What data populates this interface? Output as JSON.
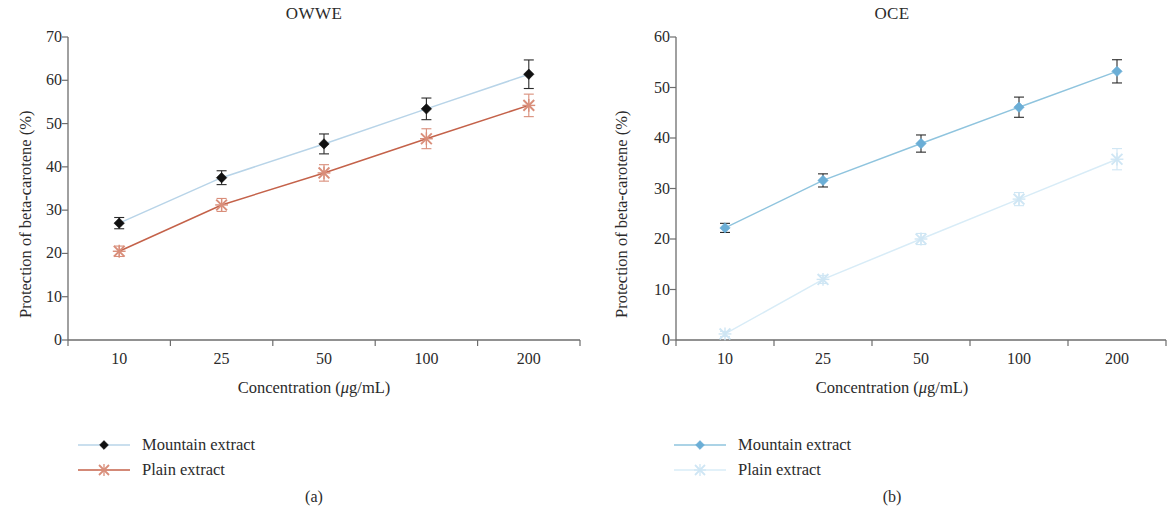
{
  "figure": {
    "subcaptions": [
      "(a)",
      "(b)"
    ]
  },
  "panels": [
    {
      "id": "a",
      "title": "OWWE",
      "subcaption": "(a)",
      "xlabel_prefix": "Concentration (",
      "xlabel_mu": "μ",
      "xlabel_suffix": "g/mL)",
      "ylabel": "Protection of beta-carotene (%)",
      "yticks": [
        "70",
        "60",
        "50",
        "40",
        "30",
        "20",
        "10",
        "0"
      ],
      "xticks": [
        "10",
        "25",
        "50",
        "100",
        "200"
      ],
      "legend": [
        {
          "label": "Mountain extract",
          "marker": "diamond",
          "color": "#111111",
          "line_color": "#b8d4e8"
        },
        {
          "label": "Plain extract",
          "marker": "cross",
          "color": "#d98e7a",
          "line_color": "#c4624a"
        }
      ]
    },
    {
      "id": "b",
      "title": "OCE",
      "subcaption": "(b)",
      "xlabel_prefix": "Concentration (",
      "xlabel_mu": "μ",
      "xlabel_suffix": "g/mL)",
      "ylabel": "Protection of beta-carotene (%)",
      "yticks": [
        "60",
        "50",
        "40",
        "30",
        "20",
        "10",
        "0"
      ],
      "xticks": [
        "10",
        "25",
        "50",
        "100",
        "200"
      ],
      "legend": [
        {
          "label": "Mountain extract",
          "marker": "diamond",
          "color": "#6baed6",
          "line_color": "#8fc4de"
        },
        {
          "label": "Plain extract",
          "marker": "cross",
          "color": "#cfe6f4",
          "line_color": "#d8ecf7"
        }
      ]
    }
  ],
  "chart_data": [
    {
      "type": "line",
      "title": "OWWE",
      "subcaption": "(a)",
      "xlabel": "Concentration (μg/mL)",
      "ylabel": "Protection of beta-carotene (%)",
      "categories": [
        "10",
        "25",
        "50",
        "100",
        "200"
      ],
      "ylim": [
        0,
        70
      ],
      "yticks": [
        0,
        10,
        20,
        30,
        40,
        50,
        60,
        70
      ],
      "grid": false,
      "legend_position": "below-left",
      "errorbars": true,
      "series": [
        {
          "name": "Mountain extract",
          "color": "#111111",
          "line_color": "#b8d4e8",
          "marker": "diamond",
          "values": [
            27.0,
            37.5,
            45.3,
            53.4,
            61.4
          ],
          "errors": [
            1.3,
            1.6,
            2.3,
            2.5,
            3.3
          ]
        },
        {
          "name": "Plain extract",
          "color": "#d98e7a",
          "line_color": "#c4624a",
          "marker": "cross",
          "values": [
            20.5,
            31.2,
            38.6,
            46.5,
            54.2
          ],
          "errors": [
            1.2,
            1.5,
            1.9,
            2.3,
            2.6
          ]
        }
      ]
    },
    {
      "type": "line",
      "title": "OCE",
      "subcaption": "(b)",
      "xlabel": "Concentration (μg/mL)",
      "ylabel": "Protection of beta-carotene (%)",
      "categories": [
        "10",
        "25",
        "50",
        "100",
        "200"
      ],
      "ylim": [
        0,
        60
      ],
      "yticks": [
        0,
        10,
        20,
        30,
        40,
        50,
        60
      ],
      "grid": false,
      "legend_position": "below-left",
      "errorbars": true,
      "series": [
        {
          "name": "Mountain extract",
          "color": "#6baed6",
          "line_color": "#8fc4de",
          "marker": "diamond",
          "values": [
            22.2,
            31.6,
            38.9,
            46.1,
            53.2
          ],
          "errors": [
            0.9,
            1.3,
            1.7,
            2.0,
            2.3
          ]
        },
        {
          "name": "Plain extract",
          "color": "#cfe6f4",
          "line_color": "#d8ecf7",
          "marker": "cross",
          "values": [
            1.2,
            12.0,
            20.0,
            27.9,
            35.8
          ],
          "errors": [
            0.5,
            0.8,
            1.1,
            1.3,
            2.1
          ]
        }
      ]
    }
  ]
}
